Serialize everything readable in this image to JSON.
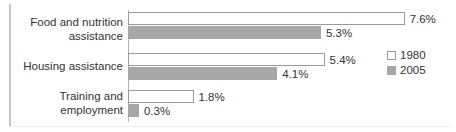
{
  "chart_data": {
    "type": "bar",
    "orientation": "horizontal",
    "title": "",
    "subtitle": "",
    "xlabel": "",
    "ylabel": "",
    "grid": false,
    "legend_position": "right",
    "xlim": [
      0,
      8
    ],
    "value_suffix": "%",
    "categories": [
      "Food and nutrition\nassistance",
      "Housing assistance",
      "Training and\nemployment"
    ],
    "series": [
      {
        "name": "1980",
        "color": "#ffffff",
        "border_color": "#9a9a9a",
        "values": [
          7.6,
          5.4,
          1.8
        ],
        "labels": [
          "7.6%",
          "5.4%",
          "1.8%"
        ]
      },
      {
        "name": "2005",
        "color": "#a8a8a8",
        "border_color": "#a8a8a8",
        "values": [
          5.3,
          4.1,
          0.3
        ],
        "labels": [
          "5.3%",
          "4.1%",
          "0.3%"
        ]
      }
    ]
  },
  "legend": {
    "entries": [
      {
        "label": "1980"
      },
      {
        "label": "2005"
      }
    ]
  },
  "colors": {
    "series_1980_fill": "#ffffff",
    "series_1980_border": "#9a9a9a",
    "series_2005_fill": "#a8a8a8",
    "axis": "#b4b4b4",
    "text": "#333333",
    "rule": "#c6c6c6"
  }
}
